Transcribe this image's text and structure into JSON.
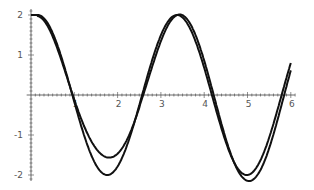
{
  "chart_data": {
    "type": "line",
    "title": "",
    "xlabel": "",
    "ylabel": "",
    "xlim": [
      0,
      6.1
    ],
    "ylim": [
      -2.1,
      2.1
    ],
    "grid": false,
    "legend": null,
    "x_ticks": [
      "1",
      "2",
      "3",
      "4",
      "5",
      "6"
    ],
    "y_ticks": [
      "2",
      "1",
      "-1",
      "-2"
    ],
    "series": [
      {
        "name": "curve-exact",
        "x": [
          0,
          0.5,
          0.95,
          1.6,
          2.4,
          3.3,
          4.1,
          4.8,
          5.6,
          6.0
        ],
        "y": [
          2.0,
          1.2,
          0.0,
          -2.05,
          0.0,
          2.05,
          0.0,
          -2.05,
          0.0,
          1.45
        ]
      },
      {
        "name": "curve-approx",
        "x": [
          0,
          0.5,
          0.95,
          1.6,
          2.4,
          3.4,
          4.15,
          4.9,
          5.6,
          6.0
        ],
        "y": [
          2.0,
          1.2,
          0.0,
          -1.55,
          0.0,
          1.85,
          0.0,
          -1.85,
          0.0,
          1.4
        ]
      }
    ]
  }
}
